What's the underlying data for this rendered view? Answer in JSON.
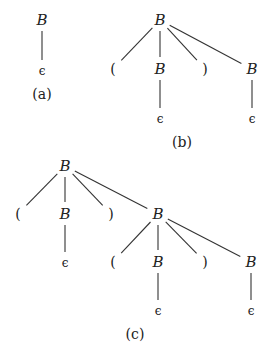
{
  "diagram": {
    "trees": [
      {
        "id": "a",
        "label": "(a)",
        "nodes": [
          {
            "id": "a0",
            "text": "B",
            "x": 42,
            "y": 20,
            "kind": "nonterminal"
          },
          {
            "id": "a1",
            "text": "ϵ",
            "x": 42,
            "y": 70,
            "kind": "epsilon"
          }
        ],
        "edges": [
          [
            "a0",
            "a1"
          ]
        ]
      },
      {
        "id": "b",
        "label": "(b)",
        "nodes": [
          {
            "id": "b0",
            "text": "B",
            "x": 160,
            "y": 20,
            "kind": "nonterminal"
          },
          {
            "id": "b1",
            "text": "(",
            "x": 113,
            "y": 69,
            "kind": "terminal"
          },
          {
            "id": "b2",
            "text": "B",
            "x": 160,
            "y": 69,
            "kind": "nonterminal"
          },
          {
            "id": "b3",
            "text": ")",
            "x": 205,
            "y": 69,
            "kind": "terminal"
          },
          {
            "id": "b4",
            "text": "B",
            "x": 252,
            "y": 69,
            "kind": "nonterminal"
          },
          {
            "id": "b5",
            "text": "ϵ",
            "x": 160,
            "y": 118,
            "kind": "epsilon"
          },
          {
            "id": "b6",
            "text": "ϵ",
            "x": 252,
            "y": 118,
            "kind": "epsilon"
          }
        ],
        "edges": [
          [
            "b0",
            "b1"
          ],
          [
            "b0",
            "b2"
          ],
          [
            "b0",
            "b3"
          ],
          [
            "b0",
            "b4"
          ],
          [
            "b2",
            "b5"
          ],
          [
            "b4",
            "b6"
          ]
        ]
      },
      {
        "id": "c",
        "label": "(c)",
        "nodes": [
          {
            "id": "c0",
            "text": "B",
            "x": 65,
            "y": 166,
            "kind": "nonterminal"
          },
          {
            "id": "c1",
            "text": "(",
            "x": 18,
            "y": 214,
            "kind": "terminal"
          },
          {
            "id": "c2",
            "text": "B",
            "x": 65,
            "y": 214,
            "kind": "nonterminal"
          },
          {
            "id": "c3",
            "text": ")",
            "x": 111,
            "y": 214,
            "kind": "terminal"
          },
          {
            "id": "c4",
            "text": "B",
            "x": 158,
            "y": 214,
            "kind": "nonterminal"
          },
          {
            "id": "c5",
            "text": "ϵ",
            "x": 65,
            "y": 262,
            "kind": "epsilon"
          },
          {
            "id": "c6",
            "text": "(",
            "x": 113,
            "y": 262,
            "kind": "terminal"
          },
          {
            "id": "c7",
            "text": "B",
            "x": 158,
            "y": 262,
            "kind": "nonterminal"
          },
          {
            "id": "c8",
            "text": ")",
            "x": 205,
            "y": 262,
            "kind": "terminal"
          },
          {
            "id": "c9",
            "text": "B",
            "x": 251,
            "y": 262,
            "kind": "nonterminal"
          },
          {
            "id": "c10",
            "text": "ϵ",
            "x": 158,
            "y": 310,
            "kind": "epsilon"
          },
          {
            "id": "c11",
            "text": "ϵ",
            "x": 251,
            "y": 310,
            "kind": "epsilon"
          }
        ],
        "edges": [
          [
            "c0",
            "c1"
          ],
          [
            "c0",
            "c2"
          ],
          [
            "c0",
            "c3"
          ],
          [
            "c0",
            "c4"
          ],
          [
            "c2",
            "c5"
          ],
          [
            "c4",
            "c6"
          ],
          [
            "c4",
            "c7"
          ],
          [
            "c4",
            "c8"
          ],
          [
            "c4",
            "c9"
          ],
          [
            "c7",
            "c10"
          ],
          [
            "c9",
            "c11"
          ]
        ]
      }
    ],
    "labels": [
      {
        "text": "(a)",
        "x": 42,
        "y": 94
      },
      {
        "text": "(b)",
        "x": 182,
        "y": 142
      },
      {
        "text": "(c)",
        "x": 135,
        "y": 334
      }
    ]
  }
}
